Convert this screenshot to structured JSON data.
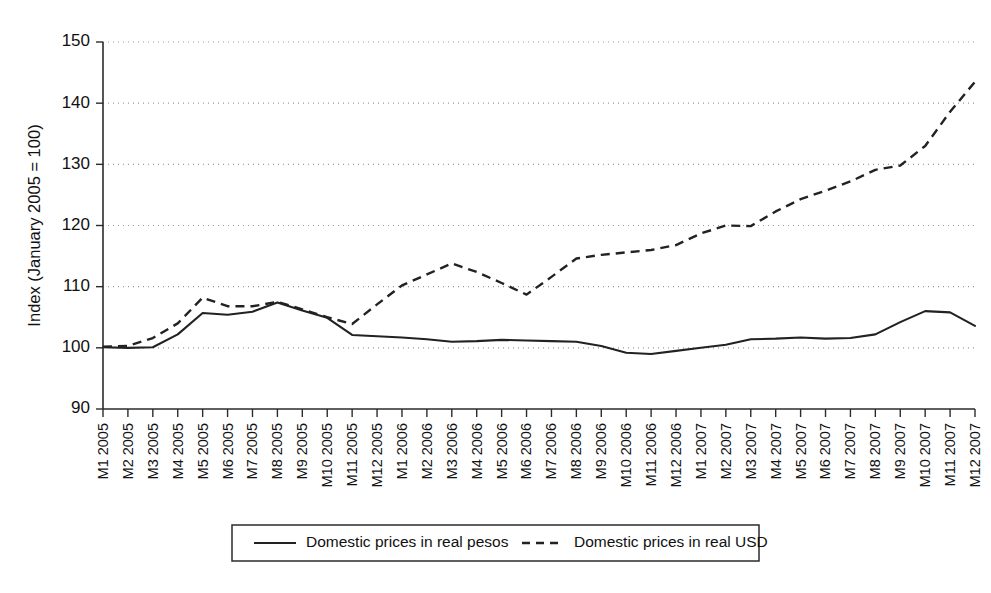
{
  "chart_data": {
    "type": "line",
    "title": "",
    "subtitle": "",
    "xlabel": "",
    "ylabel": "Index (January 2005 = 100)",
    "ylim": [
      90,
      150
    ],
    "ytick_values": [
      90,
      100,
      110,
      120,
      130,
      140,
      150
    ],
    "ytick_labels": [
      "90",
      "100",
      "110",
      "120",
      "130",
      "140",
      "150"
    ],
    "grid": true,
    "grid_axis": "y",
    "legend_position": "bottom",
    "categories": [
      "M1 2005",
      "M2 2005",
      "M3 2005",
      "M4 2005",
      "M5 2005",
      "M6 2005",
      "M7 2005",
      "M8 2005",
      "M9 2005",
      "M10 2005",
      "M11 2005",
      "M12 2005",
      "M1 2006",
      "M2 2006",
      "M3 2006",
      "M4 2006",
      "M5 2006",
      "M6 2006",
      "M7 2006",
      "M8 2006",
      "M9 2006",
      "M10 2006",
      "M11 2006",
      "M12 2006",
      "M1 2007",
      "M2 2007",
      "M3 2007",
      "M4 2007",
      "M5 2007",
      "M6 2007",
      "M7 2007",
      "M8 2007",
      "M9 2007",
      "M10 2007",
      "M11 2007",
      "M12 2007"
    ],
    "series": [
      {
        "name": "Domestic prices in real pesos",
        "style": "solid",
        "color": "#222222",
        "values": [
          100.1,
          100.0,
          100.1,
          102.2,
          105.7,
          105.4,
          105.9,
          107.4,
          106.1,
          104.9,
          102.1,
          101.9,
          101.7,
          101.4,
          101.0,
          101.1,
          101.3,
          101.2,
          101.1,
          101.0,
          100.3,
          99.2,
          99.0,
          99.5,
          100.0,
          100.5,
          101.4,
          101.5,
          101.7,
          101.5,
          101.6,
          102.2,
          104.2,
          106.0,
          105.8,
          103.6
        ]
      },
      {
        "name": "Domestic prices in real USD",
        "style": "dashed",
        "color": "#222222",
        "values": [
          100.2,
          100.3,
          101.6,
          104.0,
          108.2,
          106.8,
          106.8,
          107.5,
          106.3,
          105.0,
          103.9,
          107.1,
          110.2,
          112.0,
          113.8,
          112.4,
          110.6,
          108.7,
          111.6,
          114.6,
          115.2,
          115.6,
          116.0,
          116.8,
          118.7,
          120.0,
          119.9,
          122.3,
          124.3,
          125.7,
          127.2,
          129.1,
          129.8,
          133.0,
          138.6,
          143.5
        ]
      }
    ]
  },
  "legend": {
    "items": [
      {
        "label": "Domestic prices in real pesos",
        "style": "solid"
      },
      {
        "label": "Domestic prices in real USD",
        "style": "dashed"
      }
    ]
  }
}
